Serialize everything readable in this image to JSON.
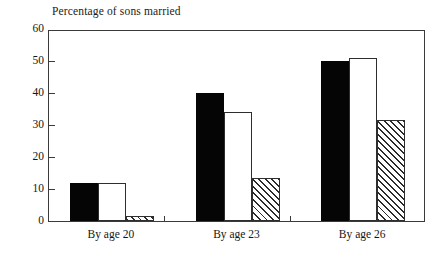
{
  "chart_data": {
    "type": "bar",
    "title": "Percentage of sons married",
    "xlabel": "",
    "ylabel": "",
    "ylim": [
      0,
      60
    ],
    "yticks": [
      0,
      10,
      20,
      30,
      40,
      50,
      60
    ],
    "grid": false,
    "legend": "none",
    "categories": [
      "By age 20",
      "By age 23",
      "By age 26"
    ],
    "series": [
      {
        "name": "series-1",
        "style": "solid-black",
        "values": [
          12,
          40,
          50
        ]
      },
      {
        "name": "series-2",
        "style": "open-white",
        "values": [
          12,
          34,
          51
        ]
      },
      {
        "name": "series-3",
        "style": "diagonal-hatch",
        "values": [
          1.5,
          13.5,
          31.5
        ]
      }
    ]
  },
  "axis": {
    "y_tick_labels": [
      "0",
      "10",
      "20",
      "30",
      "40",
      "50",
      "60"
    ]
  },
  "colors": {
    "solid": "#050505",
    "open": "#ffffff",
    "hatch_line": "#2b2b2b",
    "frame": "#3a3a3a",
    "text": "#161616"
  }
}
